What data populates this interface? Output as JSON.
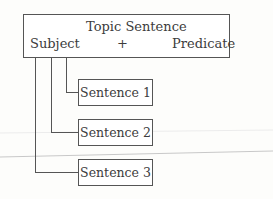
{
  "topic_box": {
    "title": "Topic Sentence",
    "subject": "Subject",
    "plus": "+",
    "predicate": "Predicate"
  },
  "sentences": [
    {
      "label": "Sentence 1"
    },
    {
      "label": "Sentence 2"
    },
    {
      "label": "Sentence 3"
    }
  ]
}
